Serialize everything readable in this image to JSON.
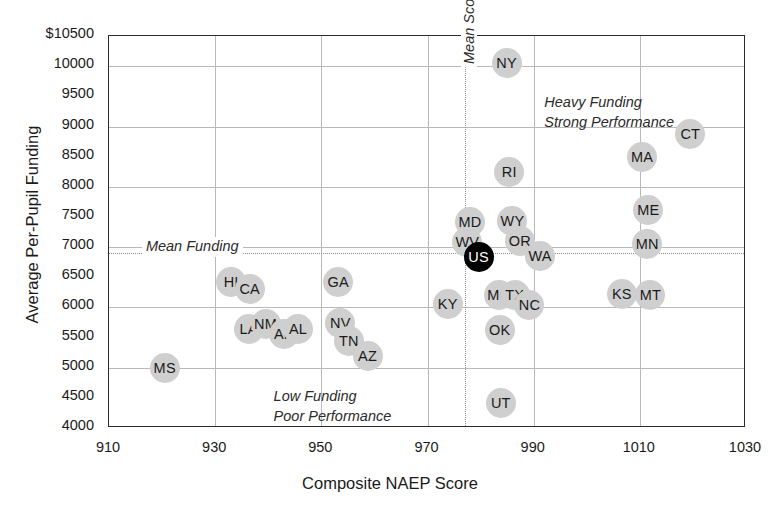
{
  "chart_data": {
    "type": "scatter",
    "title": "",
    "xlabel": "Composite NAEP Score",
    "ylabel": "Average Per-Pupil Funding",
    "xlim": [
      910,
      1030
    ],
    "ylim": [
      4000,
      10500
    ],
    "xticks": [
      "910",
      "930",
      "950",
      "970",
      "990",
      "1010",
      "1030"
    ],
    "xtick_values": [
      910,
      930,
      950,
      970,
      990,
      1010,
      1030
    ],
    "yticks": [
      "$10500",
      "10000",
      "9500",
      "9000",
      "8500",
      "8000",
      "7500",
      "7000",
      "6500",
      "6000",
      "5500",
      "5000",
      "4500",
      "4000"
    ],
    "ytick_values": [
      10500,
      10000,
      9500,
      9000,
      8500,
      8000,
      7500,
      7000,
      6500,
      6000,
      5500,
      5000,
      4500,
      4000
    ],
    "xgridlines": [
      930,
      950,
      970,
      990,
      1010
    ],
    "ygridlines": [
      10000,
      9000,
      8000,
      7000,
      6000,
      5000
    ],
    "grid": true,
    "legend": "none",
    "reference_lines": {
      "mean_score": {
        "label": "Mean Score",
        "x": 977,
        "orientation": "vertical",
        "style": "dotted"
      },
      "mean_funding": {
        "label": "Mean Funding",
        "y": 6900,
        "orientation": "horizontal",
        "style": "dotted"
      }
    },
    "annotations": [
      {
        "id": "heavy-strong",
        "line1": "Heavy Funding",
        "line2": "Strong Performance",
        "x": 992,
        "y": 9550
      },
      {
        "id": "low-poor",
        "line1": "Low Funding",
        "line2": "Poor Performance",
        "x": 941,
        "y": 4680
      }
    ],
    "point_label": "state",
    "points": [
      {
        "label": "MS",
        "x": 920.5,
        "y": 5000,
        "pos": "c"
      },
      {
        "label": "HI",
        "x": 933.0,
        "y": 6420,
        "pos": "c"
      },
      {
        "label": "CA",
        "x": 936.5,
        "y": 6300,
        "pos": "c"
      },
      {
        "label": "LA",
        "x": 936.3,
        "y": 5650,
        "pos": "c"
      },
      {
        "label": "NM",
        "x": 939.5,
        "y": 5730,
        "pos": "c"
      },
      {
        "label": "AR",
        "x": 943.0,
        "y": 5560,
        "pos": "c"
      },
      {
        "label": "AL",
        "x": 945.6,
        "y": 5650,
        "pos": "c"
      },
      {
        "label": "GA",
        "x": 953.2,
        "y": 6430,
        "pos": "c"
      },
      {
        "label": "NV",
        "x": 953.6,
        "y": 5740,
        "pos": "c"
      },
      {
        "label": "TN",
        "x": 955.2,
        "y": 5450,
        "pos": "c"
      },
      {
        "label": "AZ",
        "x": 958.7,
        "y": 5200,
        "pos": "c"
      },
      {
        "label": "KY",
        "x": 973.8,
        "y": 6060,
        "pos": "c"
      },
      {
        "label": "MD",
        "x": 978.0,
        "y": 7410,
        "pos": "c"
      },
      {
        "label": "WV",
        "x": 977.5,
        "y": 7090,
        "pos": "c"
      },
      {
        "label": "US",
        "x": 979.6,
        "y": 6830,
        "pos": "c",
        "highlight": true
      },
      {
        "label": "MO",
        "x": 983.5,
        "y": 6200,
        "pos": "c"
      },
      {
        "label": "OK",
        "x": 983.6,
        "y": 5620,
        "pos": "c"
      },
      {
        "label": "UT",
        "x": 983.8,
        "y": 4420,
        "pos": "c"
      },
      {
        "label": "NY",
        "x": 984.9,
        "y": 10060,
        "pos": "c"
      },
      {
        "label": "RI",
        "x": 985.4,
        "y": 8250,
        "pos": "c"
      },
      {
        "label": "WY",
        "x": 986.0,
        "y": 7430,
        "pos": "c"
      },
      {
        "label": "TX",
        "x": 986.4,
        "y": 6200,
        "pos": "c"
      },
      {
        "label": "OR",
        "x": 987.4,
        "y": 7100,
        "pos": "c"
      },
      {
        "label": "NC",
        "x": 989.2,
        "y": 6040,
        "pos": "c"
      },
      {
        "label": "WA",
        "x": 991.2,
        "y": 6850,
        "pos": "c"
      },
      {
        "label": "NC2",
        "x": 993.0,
        "y": 6090,
        "pos": "c",
        "hidden": true
      },
      {
        "label": "NC3",
        "x": 993.0,
        "y": 6090,
        "pos": "c",
        "hidden": true
      },
      {
        "label": "MA",
        "x": 1010.4,
        "y": 8500,
        "pos": "c"
      },
      {
        "label": "ME",
        "x": 1011.6,
        "y": 7620,
        "pos": "c"
      },
      {
        "label": "MN",
        "x": 1011.4,
        "y": 7060,
        "pos": "c"
      },
      {
        "label": "MT",
        "x": 1012.0,
        "y": 6210,
        "pos": "c"
      },
      {
        "label": "KS",
        "x": 1006.6,
        "y": 6230,
        "pos": "c"
      },
      {
        "label": "CT",
        "x": 1019.5,
        "y": 8870,
        "pos": "c"
      }
    ],
    "marker_color": "#cfcfcf",
    "highlight_color": "#000000",
    "grid_color": "#b9b9b9",
    "axis_color": "#2b2b2b"
  }
}
